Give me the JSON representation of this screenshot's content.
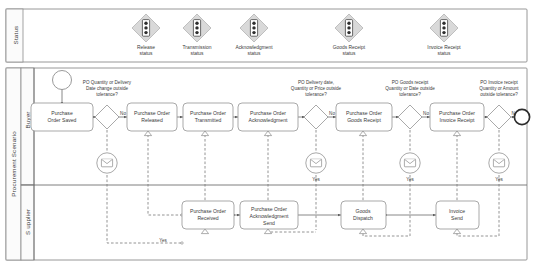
{
  "diagram": {
    "type": "bpmn-collaboration",
    "status_band": {
      "lane_label": "Status",
      "items": [
        {
          "id": "release",
          "label_line1": "Release",
          "label_line2": "status",
          "icon": "traffic-light-diamond-icon",
          "x": 146
        },
        {
          "id": "transmission",
          "label_line1": "Transmission",
          "label_line2": "status",
          "icon": "traffic-light-diamond-icon",
          "x": 197
        },
        {
          "id": "acknowledgment",
          "label_line1": "Acknowledgment",
          "label_line2": "status",
          "icon": "traffic-light-diamond-icon",
          "x": 254
        },
        {
          "id": "goods-receipt",
          "label_line1": "Goods Receipt",
          "label_line2": "status",
          "icon": "traffic-light-diamond-icon",
          "x": 349
        },
        {
          "id": "invoice-receipt",
          "label_line1": "Invoice Receipt",
          "label_line2": "status",
          "icon": "traffic-light-diamond-icon",
          "x": 444
        }
      ]
    },
    "pool": {
      "label": "Procurement Scenario",
      "lanes": [
        {
          "id": "buyer",
          "label": "Buyer"
        },
        {
          "id": "supplier",
          "label": "S upplier"
        }
      ]
    },
    "buyer_lane": {
      "start_event": {
        "id": "start",
        "type": "start-event"
      },
      "tasks": [
        {
          "id": "po-saved",
          "line1": "Purchase",
          "line2": "Order Saved",
          "cx": 62,
          "cy": 117
        },
        {
          "id": "po-released",
          "line1": "Purchase Order",
          "line2": "Released",
          "cx": 148,
          "cy": 117
        },
        {
          "id": "po-transmitted",
          "line1": "Purchase Order",
          "line2": "Transmitted",
          "cx": 205,
          "cy": 117
        },
        {
          "id": "po-acknowledgment",
          "line1": "Purchase Order",
          "line2": "Acknowledgment",
          "cx": 268,
          "cy": 117
        },
        {
          "id": "po-goods-receipt",
          "line1": "Purchase Order",
          "line2": "Goods Receipt",
          "cx": 363,
          "cy": 117
        },
        {
          "id": "po-invoice-receipt",
          "line1": "Purchase Order",
          "line2": "Invoice Receipt",
          "cx": 457,
          "cy": 117
        }
      ],
      "gateways": [
        {
          "id": "gw-po-change",
          "cx": 107,
          "cy": 117,
          "question": [
            "PO Quantity or Delivery",
            "Date change outside",
            "tolerance?"
          ],
          "no_label": "No",
          "yes_label": "Yes"
        },
        {
          "id": "gw-po-ack",
          "cx": 316,
          "cy": 117,
          "question": [
            "PO Delivery date,",
            "Quantity or Price outside",
            "tolerance?"
          ],
          "no_label": "No",
          "yes_label": "Yes"
        },
        {
          "id": "gw-goods-receipt",
          "cx": 410,
          "cy": 117,
          "question": [
            "PO Goods receipt",
            "Quantity or Date outside",
            "tolerance?"
          ],
          "no_label": "No",
          "yes_label": "Yes"
        },
        {
          "id": "gw-invoice-receipt",
          "cx": 499,
          "cy": 117,
          "question": [
            "PO Invoice receipt",
            "Quantity or Amount",
            "outside tolerance?"
          ],
          "no_label": "No",
          "yes_label": "Yes"
        }
      ],
      "end_event": {
        "id": "end",
        "type": "end-event",
        "cx": 521,
        "cy": 117
      },
      "message_events": [
        {
          "id": "msg-po-change",
          "cx": 107,
          "cy": 163,
          "label": ""
        },
        {
          "id": "msg-ack",
          "cx": 316,
          "cy": 163,
          "label": "Yes"
        },
        {
          "id": "msg-goods",
          "cx": 410,
          "cy": 163,
          "label": "Yes"
        },
        {
          "id": "msg-invoice",
          "cx": 499,
          "cy": 163,
          "label": "Yes"
        }
      ]
    },
    "supplier_lane": {
      "tasks": [
        {
          "id": "po-received",
          "line1": "Purchase Order",
          "line2": "Received",
          "line3": "",
          "cx": 205,
          "cy": 215
        },
        {
          "id": "po-ack-send",
          "line1": "Purchase Order",
          "line2": "Acknowledgment",
          "line3": "Send",
          "cx": 268,
          "cy": 215
        },
        {
          "id": "goods-dispatch",
          "line1": "Goods",
          "line2": "Dispatch",
          "line3": "",
          "cx": 363,
          "cy": 215
        },
        {
          "id": "invoice-send",
          "line1": "Invoice",
          "line2": "Send",
          "line3": "",
          "cx": 457,
          "cy": 215
        }
      ],
      "flow_labels": [
        {
          "id": "yes-return",
          "label": "Yes",
          "x": 163,
          "y": 243
        }
      ]
    },
    "colors": {
      "status_diamond_fill": "#d9d9d9",
      "status_diamond_stroke": "#b4b4b4",
      "shape_stroke": "#9a9a9a",
      "flow_stroke": "#6a6a6a",
      "text": "#3a3a3a",
      "lane_strip": "#fbfbfb",
      "background": "#ffffff"
    }
  }
}
